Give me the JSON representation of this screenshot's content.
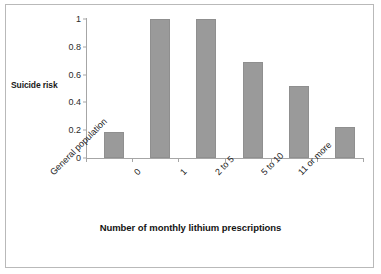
{
  "chart_data": {
    "type": "bar",
    "title": "",
    "subtitle": "",
    "xlabel": "Number of monthly lithium prescriptions",
    "ylabel": "Suicide risk",
    "categories": [
      "General population",
      "0",
      "1",
      "2 to 5",
      "5 to 10",
      "11 or more"
    ],
    "values": [
      0.19,
      1.0,
      1.0,
      0.69,
      0.52,
      0.22
    ],
    "ylim": [
      0,
      1
    ],
    "yticks": [
      "0",
      "0.2",
      "0.4",
      "0.6",
      "0.8",
      "1"
    ],
    "ytick_values": [
      0,
      0.2,
      0.4,
      0.6,
      0.8,
      1
    ],
    "grid": false,
    "legend": null,
    "legend_position": "none",
    "bar_color": "#9a9a9a",
    "axis_color": "#a6a6a6",
    "text_color": "#1a1a1a",
    "frame_color": "#b9b9b9",
    "background": "#ffffff",
    "xtick_label_rotation": -45
  }
}
